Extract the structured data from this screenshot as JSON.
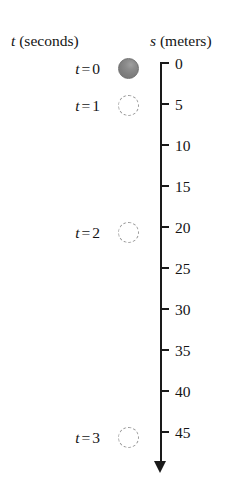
{
  "figure": {
    "columns": {
      "time_header_var": "t",
      "time_header_unit": "(seconds)",
      "distance_header_var": "s",
      "distance_header_unit": "(meters)"
    },
    "time_rows": [
      {
        "var": "t",
        "eq": "=",
        "value": "0",
        "y": 68
      },
      {
        "var": "t",
        "eq": "=",
        "value": "1",
        "y": 105
      },
      {
        "var": "t",
        "eq": "=",
        "value": "2",
        "y": 232
      },
      {
        "var": "t",
        "eq": "=",
        "value": "3",
        "y": 437
      }
    ],
    "balls": [
      {
        "state": "solid",
        "t": "0",
        "s": 0,
        "y": 68
      },
      {
        "state": "ghost",
        "t": "1",
        "s": 5,
        "y": 105
      },
      {
        "state": "ghost",
        "t": "2",
        "s": 20,
        "y": 232
      },
      {
        "state": "ghost",
        "t": "3",
        "s": 45,
        "y": 437
      }
    ],
    "axis": {
      "orientation": "vertical-down",
      "arrow": "down-arrow",
      "top_y": 63,
      "bottom_y": 461,
      "x": 160,
      "tick_spacing_px": 41,
      "labels": [
        "0",
        "5",
        "10",
        "15",
        "20",
        "25",
        "30",
        "35",
        "40",
        "45"
      ],
      "values": [
        0,
        5,
        10,
        15,
        20,
        25,
        30,
        35,
        40,
        45
      ]
    },
    "colors": {
      "ink": "#1a1a1a",
      "ball_fill": "#808080",
      "ghost_stroke": "#9a9a9a",
      "background": "#ffffff"
    }
  },
  "chart_data": {
    "type": "scatter",
    "title": "",
    "xlabel": "t (seconds)",
    "ylabel": "s (meters)",
    "x": [
      0,
      1,
      2,
      3
    ],
    "values": [
      0,
      5,
      20,
      45
    ],
    "categories": [
      "t = 0",
      "t = 1",
      "t = 2",
      "t = 3"
    ],
    "series": [
      {
        "name": "s (meters)",
        "values": [
          0,
          5,
          20,
          45
        ]
      }
    ],
    "ylim": [
      0,
      45
    ],
    "yticks": [
      0,
      5,
      10,
      15,
      20,
      25,
      30,
      35,
      40,
      45
    ],
    "grid": false,
    "legend": "none",
    "annotations": [
      "axis points downward (increasing distance fallen)",
      "solid ball at t = 0, dashed outlines at t = 1, 2, 3"
    ]
  }
}
